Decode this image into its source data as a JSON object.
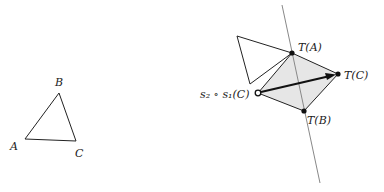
{
  "original_triangle": {
    "labels": {
      "A": "A",
      "B": "B",
      "C": "C"
    },
    "points": {
      "A": [
        25,
        139
      ],
      "B": [
        59,
        93
      ],
      "C": [
        76,
        141
      ]
    }
  },
  "transformed_figure": {
    "labels": {
      "TA": "T(A)",
      "TB": "T(B)",
      "TC": "T(C)",
      "s2s1C": "s₂ ∘ s₁(C)"
    },
    "points": {
      "TA": [
        292,
        53
      ],
      "TB": [
        304,
        111
      ],
      "TC": [
        338,
        74
      ],
      "s2s1C": [
        258,
        93
      ],
      "white_tri_top": [
        237,
        36
      ],
      "white_tri_bottom": [
        250,
        84
      ]
    },
    "reflection_line": {
      "from": [
        282,
        5
      ],
      "to": [
        320,
        183
      ]
    },
    "shaded_fill": "#e6e6e6"
  }
}
